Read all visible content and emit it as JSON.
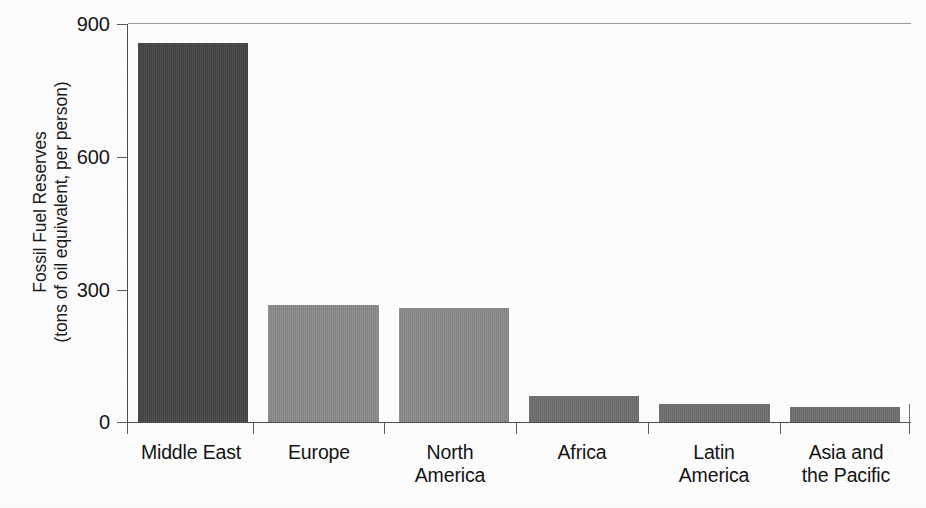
{
  "chart_data": {
    "type": "bar",
    "title": "",
    "subtitle": "",
    "xlabel": "",
    "ylabel_line1": "Fossil Fuel Reserves",
    "ylabel_line2": "(tons of oil equivalent, per person)",
    "categories": [
      "Middle East",
      "Europe",
      "North\nAmerica",
      "Africa",
      "Latin\nAmerica",
      "Asia and\nthe Pacific"
    ],
    "values": [
      857,
      265,
      258,
      58,
      41,
      34
    ],
    "bar_colors": [
      "#454545",
      "#8a8a8a",
      "#8a8a8a",
      "#6e6e6e",
      "#6e6e6e",
      "#6e6e6e"
    ],
    "ylim": [
      0,
      900
    ],
    "yticks": [
      0,
      300,
      600,
      900
    ],
    "ytick_labels": [
      "0",
      "300",
      "600",
      "900"
    ],
    "grid": false,
    "legend": "none",
    "series": [
      {
        "name": "Fossil Fuel Reserves per person",
        "points": [
          {
            "category": "Middle East",
            "value": 857,
            "color": "#454545"
          },
          {
            "category": "Europe",
            "value": 265,
            "color": "#8a8a8a"
          },
          {
            "category": "North America",
            "value": 258,
            "color": "#8a8a8a"
          },
          {
            "category": "Africa",
            "value": 58,
            "color": "#6e6e6e"
          },
          {
            "category": "Latin America",
            "value": 41,
            "color": "#6e6e6e"
          },
          {
            "category": "Asia and the Pacific",
            "value": 34,
            "color": "#6e6e6e"
          }
        ]
      }
    ]
  },
  "axis": {
    "line_color": "#4e4e4e",
    "top_border_color": "#9a9a9a"
  },
  "figure": {
    "background": "#fdfdfd"
  }
}
